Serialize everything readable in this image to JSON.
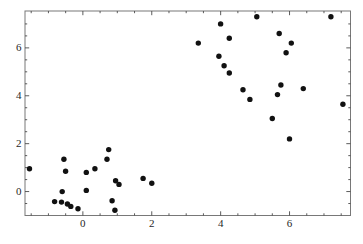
{
  "chart_data": {
    "type": "scatter",
    "title": "",
    "xlabel": "",
    "ylabel": "",
    "xlim": [
      -1.68,
      7.77
    ],
    "ylim": [
      -1.0,
      7.54
    ],
    "x_ticks": [
      0,
      2,
      4,
      6
    ],
    "y_ticks": [
      0,
      2,
      4,
      6
    ],
    "x_tick_labels": [
      "0",
      "2",
      "4",
      "6"
    ],
    "y_tick_labels": [
      "0",
      "2",
      "4",
      "6"
    ],
    "minor_tick_step": 0.5,
    "grid": false,
    "legend": false,
    "frame": true,
    "frame_color": "#787878",
    "tick_color": "#4a4a4a",
    "label_color": "#1f1f1f",
    "marker_color": "#111111",
    "marker_radius_px": 2.7,
    "points": [
      [
        4.0,
        7.0
      ],
      [
        5.05,
        7.3
      ],
      [
        7.2,
        7.3
      ],
      [
        3.35,
        6.2
      ],
      [
        4.25,
        6.4
      ],
      [
        5.7,
        6.6
      ],
      [
        6.05,
        6.2
      ],
      [
        5.9,
        5.8
      ],
      [
        3.95,
        5.65
      ],
      [
        4.1,
        5.25
      ],
      [
        4.25,
        4.95
      ],
      [
        4.65,
        4.25
      ],
      [
        4.85,
        3.85
      ],
      [
        5.75,
        4.45
      ],
      [
        5.65,
        4.05
      ],
      [
        6.4,
        4.3
      ],
      [
        7.55,
        3.65
      ],
      [
        5.5,
        3.05
      ],
      [
        6.0,
        2.2
      ],
      [
        -1.55,
        0.95
      ],
      [
        -0.55,
        1.35
      ],
      [
        -0.5,
        0.85
      ],
      [
        0.1,
        0.8
      ],
      [
        0.35,
        0.95
      ],
      [
        0.75,
        1.75
      ],
      [
        0.7,
        1.35
      ],
      [
        0.95,
        0.45
      ],
      [
        1.05,
        0.3
      ],
      [
        -0.6,
        0.0
      ],
      [
        0.1,
        0.05
      ],
      [
        -0.82,
        -0.42
      ],
      [
        -0.62,
        -0.44
      ],
      [
        -0.45,
        -0.52
      ],
      [
        -0.35,
        -0.62
      ],
      [
        -0.14,
        -0.72
      ],
      [
        0.85,
        -0.38
      ],
      [
        0.93,
        -0.78
      ],
      [
        1.75,
        0.55
      ],
      [
        2.0,
        0.35
      ]
    ]
  }
}
